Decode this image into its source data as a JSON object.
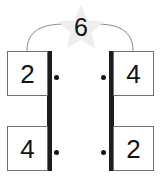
{
  "diagram": {
    "type": "number-bond-multiplication",
    "total": {
      "value": "6",
      "icon": "star-badge",
      "star_fill": "#eeeeee"
    },
    "operator_symbol": "·",
    "groups": [
      {
        "side": "left",
        "spine_color": "#1d1d1d",
        "cards": [
          {
            "position": "top",
            "value": "2"
          },
          {
            "position": "bottom",
            "value": "4"
          }
        ]
      },
      {
        "side": "right",
        "spine_color": "#1d1d1d",
        "cards": [
          {
            "position": "top",
            "value": "4"
          },
          {
            "position": "bottom",
            "value": "2"
          }
        ]
      }
    ],
    "connector": {
      "stroke": "#8a8a8a",
      "left_path": "M 27 51 C 27 28 44 24 66 24",
      "right_path": "M 133 51 C 133 28 116 24 95 24"
    }
  }
}
